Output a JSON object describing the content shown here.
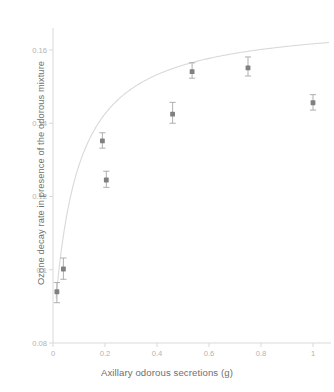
{
  "chart_data": {
    "type": "scatter",
    "title": "",
    "xlabel": "Axillary odorous secretions (g)",
    "ylabel": "Ozone decay rate in presence of the odorous mixture",
    "xlim": [
      0,
      1.08
    ],
    "ylim": [
      0.08,
      0.165
    ],
    "xticks": [
      "0",
      "0.2",
      "0.4",
      "0.6",
      "0.8",
      "1"
    ],
    "xtick_values": [
      0,
      0.2,
      0.4,
      0.6,
      0.8,
      1
    ],
    "yticks": [
      "0.08",
      "0.1",
      "0.12",
      "0.14",
      "0.16"
    ],
    "ytick_values": [
      0.08,
      0.1,
      0.12,
      0.14,
      0.16
    ],
    "grid": false,
    "legend": "none",
    "marker_color": "#808080",
    "errorbar_color": "#a6a6a6",
    "fit_color": "#d9d9d9",
    "axis_color": "#d9d9d9",
    "x": [
      0.015,
      0.04,
      0.19,
      0.205,
      0.46,
      0.535,
      0.75,
      1.0
    ],
    "y": [
      0.094,
      0.1002,
      0.1352,
      0.1245,
      0.1425,
      0.1541,
      0.1551,
      0.1456
    ],
    "yerr_lower": [
      0.003,
      0.0028,
      0.002,
      0.002,
      0.0025,
      0.0018,
      0.0022,
      0.002
    ],
    "yerr_upper": [
      0.0025,
      0.003,
      0.0022,
      0.0024,
      0.0032,
      0.0024,
      0.003,
      0.0022
    ],
    "points": [
      {
        "x": 0.015,
        "y": 0.094,
        "err_low": 0.003,
        "err_high": 0.0025
      },
      {
        "x": 0.04,
        "y": 0.1002,
        "err_low": 0.0028,
        "err_high": 0.003
      },
      {
        "x": 0.19,
        "y": 0.1352,
        "err_low": 0.002,
        "err_high": 0.0022
      },
      {
        "x": 0.205,
        "y": 0.1245,
        "err_low": 0.002,
        "err_high": 0.0024
      },
      {
        "x": 0.46,
        "y": 0.1425,
        "err_low": 0.0025,
        "err_high": 0.0032
      },
      {
        "x": 0.535,
        "y": 0.1541,
        "err_low": 0.0018,
        "err_high": 0.0024
      },
      {
        "x": 0.75,
        "y": 0.1551,
        "err_low": 0.0022,
        "err_high": 0.003
      },
      {
        "x": 1.0,
        "y": 0.1456,
        "err_low": 0.002,
        "err_high": 0.0022
      }
    ],
    "fit_curve": {
      "model": "saturating",
      "description": "Michaelis-Menten style saturating fit",
      "vmax": 0.1685,
      "km": 0.085,
      "baseline": 0.0815,
      "x_start": 0.012,
      "x_end": 1.06
    }
  }
}
